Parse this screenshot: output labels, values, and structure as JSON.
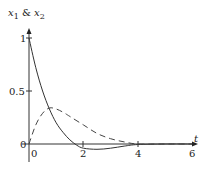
{
  "chart_data": {
    "type": "line",
    "title": "",
    "ylabel": "x1 & x2",
    "xlabel": "t",
    "xlim": [
      0,
      6
    ],
    "ylim": [
      -0.1,
      1
    ],
    "grid": false,
    "x_ticks": [
      "0",
      "2",
      "4",
      "6"
    ],
    "y_ticks": [
      "0",
      "0.5",
      "1"
    ],
    "series": [
      {
        "name": "x1",
        "style": "solid",
        "x": [
          0,
          0.25,
          0.5,
          0.75,
          1.0,
          1.25,
          1.5,
          1.75,
          2.0,
          2.5,
          3.0,
          3.5,
          4.0,
          5.0,
          6.0
        ],
        "values": [
          1.0,
          0.72,
          0.5,
          0.33,
          0.2,
          0.11,
          0.04,
          -0.01,
          -0.04,
          -0.05,
          -0.04,
          -0.02,
          -0.005,
          0.0,
          0.0
        ]
      },
      {
        "name": "x2",
        "style": "dashed",
        "x": [
          0,
          0.25,
          0.5,
          0.75,
          1.0,
          1.25,
          1.5,
          2.0,
          2.5,
          3.0,
          3.5,
          4.0,
          5.0,
          6.0
        ],
        "values": [
          0.0,
          0.18,
          0.29,
          0.34,
          0.33,
          0.3,
          0.26,
          0.18,
          0.1,
          0.05,
          0.02,
          0.0,
          0.0,
          0.0
        ]
      }
    ]
  },
  "axes": {
    "y_label_main": "x",
    "y_label_sub1": "1",
    "y_label_amp": " & ",
    "y_label_sub2": "2",
    "x_label": "t",
    "x_tick_0": "0",
    "x_tick_2": "2",
    "x_tick_4": "4",
    "x_tick_6": "6",
    "y_tick_0": "0",
    "y_tick_05": "0.5",
    "y_tick_1": "1"
  }
}
